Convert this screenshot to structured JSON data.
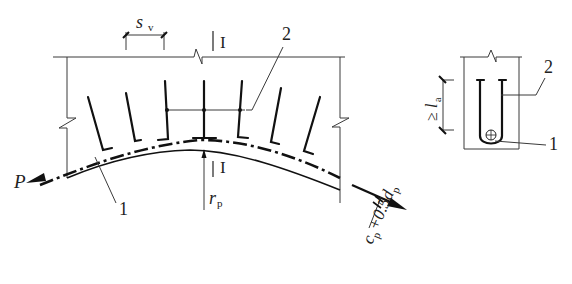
{
  "figure": {
    "elevation": {
      "spacing_label": "s",
      "spacing_sub": "v",
      "section_mark_top": "I",
      "section_mark_bottom": "I",
      "callout_stirrup": "2",
      "callout_tendon": "1",
      "force_label": "P",
      "radius_label": "r",
      "radius_sub": "p",
      "cover_label_c": "c",
      "cover_sub_c": "p",
      "cover_label_mid": "+0.5d",
      "cover_sub_d": "p"
    },
    "section": {
      "anchorage_symbol": "≥",
      "anchorage_label": "l",
      "anchorage_sub": "a",
      "callout_stirrup": "2",
      "callout_tendon": "1"
    }
  },
  "colors": {
    "line": "#111111",
    "thin": "#3a3a3a",
    "background": "#ffffff"
  }
}
